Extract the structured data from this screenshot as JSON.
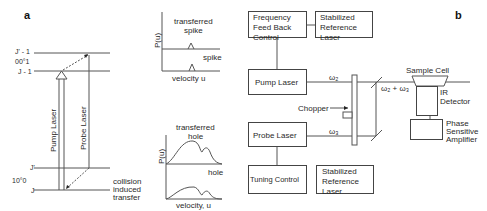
{
  "panel_a": {
    "letter": "a",
    "levels": {
      "upper_top": "J' - 1",
      "upper_state": "00°1",
      "upper_bottom": "J - 1",
      "lower_top": "J'",
      "lower_state": "10°0",
      "lower_bottom": "J"
    },
    "arrows": {
      "pump": "Pump Laser",
      "probe": "Probe Laser"
    },
    "collision_label": [
      "collision",
      "induced",
      "transfer"
    ],
    "spike_plot": {
      "ylabel": "P(u)",
      "top_label": [
        "transferred",
        "spike"
      ],
      "bottom_label": "spike",
      "xlabel": "velocity u"
    },
    "hole_plot": {
      "ylabel": "P(u)",
      "top_label": [
        "transferred",
        "hole"
      ],
      "bottom_label": "hole",
      "xlabel": "velocity, u"
    }
  },
  "panel_b": {
    "letter": "b",
    "boxes": {
      "freq_feedback": [
        "Frequency",
        "Feed Back",
        "Control"
      ],
      "ref_laser_top": [
        "Stabilized",
        "Reference",
        "Laser"
      ],
      "pump_laser": "Pump Laser",
      "probe_laser": "Probe Laser",
      "tuning_control": "Tuning Control",
      "ref_laser_bottom": [
        "Stabilized",
        "Reference",
        "Laser"
      ],
      "phase_amp": [
        "Phase",
        "Sensitive",
        "Amplifier"
      ]
    },
    "labels": {
      "omega2": "ω₂",
      "omega3": "ω₃",
      "omega_sum": "ω₂ + ω₃",
      "chopper": "Chopper",
      "sample_cell": "Sample Cell",
      "ir_detector": [
        "IR",
        "Detector"
      ]
    }
  }
}
